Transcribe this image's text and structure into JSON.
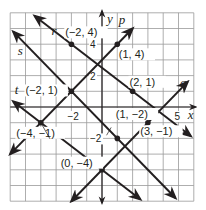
{
  "diagram": {
    "grid": {
      "xmin": -6,
      "xmax": 6,
      "ymin": -6,
      "ymax": 6,
      "step": 1
    },
    "colors": {
      "grid": "#999999",
      "axis": "#231f20",
      "line": "#231f20",
      "point": "#231f20",
      "text": "#231f20"
    },
    "axes": {
      "x_label": "x",
      "y_label": "y"
    },
    "ticks": [
      {
        "text": "-2",
        "axis": "x",
        "value": -2
      },
      {
        "text": "5",
        "axis": "x",
        "value": 5
      },
      {
        "text": "4",
        "axis": "y",
        "value": 4
      },
      {
        "text": "2",
        "axis": "y",
        "value": 2
      },
      {
        "text": "-2",
        "axis": "y",
        "value": -2
      }
    ],
    "lines": [
      {
        "name": "p",
        "slope": 1,
        "intercept": 3,
        "x1": -6,
        "x2": 2,
        "label_at": [
          1.1,
          5.3
        ]
      },
      {
        "name": "q",
        "slope": 1,
        "intercept": -4,
        "x1": -2,
        "x2": 5.6,
        "label_at": [
          5.1,
          1.3
        ]
      },
      {
        "name": "r",
        "slope": -0.75,
        "intercept": 2.5,
        "x1": -4.4,
        "x2": 5.8,
        "label_at": [
          -3.3,
          4.6
        ]
      },
      {
        "name": "s",
        "slope": -1,
        "intercept": -1,
        "x1": -5.8,
        "x2": 4.8,
        "label_at": [
          -5.5,
          3.3
        ]
      },
      {
        "name": "t",
        "slope": -0.75,
        "intercept": -4,
        "x1": -5.8,
        "x2": 2.5,
        "label_at": [
          -5.7,
          0.8
        ]
      }
    ],
    "points": [
      {
        "label": "(−2, 4)",
        "x": -2,
        "y": 4,
        "label_at": [
          -2.4,
          4.5
        ]
      },
      {
        "label": "(1, 4)",
        "x": 1,
        "y": 4,
        "label_at": [
          1.1,
          3.1
        ]
      },
      {
        "label": "(2, 1)",
        "x": 2,
        "y": 1,
        "label_at": [
          1.8,
          1.35
        ]
      },
      {
        "label": "(−2, 1)",
        "x": -2,
        "y": 1,
        "label_at": [
          -5.0,
          0.8
        ]
      },
      {
        "label": "(−4, −1)",
        "x": -4,
        "y": -1,
        "label_at": [
          -5.6,
          -1.9
        ]
      },
      {
        "label": "(1, −2)",
        "x": 1,
        "y": -2,
        "label_at": [
          0.9,
          -0.7
        ]
      },
      {
        "label": "(3, −1)",
        "x": 3,
        "y": -1,
        "label_at": [
          2.5,
          -1.8
        ]
      },
      {
        "label": "(0, −4)",
        "x": 0,
        "y": -4,
        "label_at": [
          -2.7,
          -3.8
        ]
      }
    ]
  }
}
